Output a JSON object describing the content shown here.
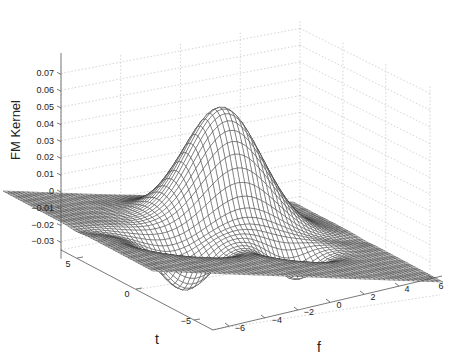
{
  "chart_data": {
    "type": "surface",
    "title": "",
    "xlabel": "f",
    "ylabel": "t",
    "zlabel": "FM Kernel",
    "x_ticks": [
      -6,
      -4,
      -2,
      0,
      2,
      4,
      6
    ],
    "y_ticks": [
      5,
      0,
      -5
    ],
    "z_ticks": [
      0.07,
      0.06,
      0.05,
      0.04,
      0.03,
      0.02,
      0.01,
      0,
      -0.01,
      -0.02,
      -0.03
    ],
    "z_tick_labels": [
      "0.07",
      "0.06",
      "0.05",
      "0.04",
      "0.03",
      "0.02",
      "0.01",
      "0",
      "−0.01",
      "−0.02",
      "−0.03"
    ],
    "x_tick_labels": [
      "−6",
      "−4",
      "−2",
      "0",
      "2",
      "4",
      "6"
    ],
    "y_tick_labels": [
      "5",
      "0",
      "−5"
    ],
    "xlim": [
      -6.5,
      6.5
    ],
    "ylim": [
      -7,
      7
    ],
    "zlim": [
      -0.035,
      0.075
    ],
    "grid": true,
    "surface": {
      "description": "Gaussian-like positive peak near f≈1, t≈3 reaching ~0.069, with small negative lobes (~-0.03) around t≈-2 at f≈-3 and f≈1.5, near-zero elsewhere",
      "peak": {
        "f": 1.0,
        "t": 3.0,
        "z": 0.069
      },
      "mesh_color": "#333333",
      "face_color": "#ffffff",
      "mesh_density": 60
    }
  }
}
